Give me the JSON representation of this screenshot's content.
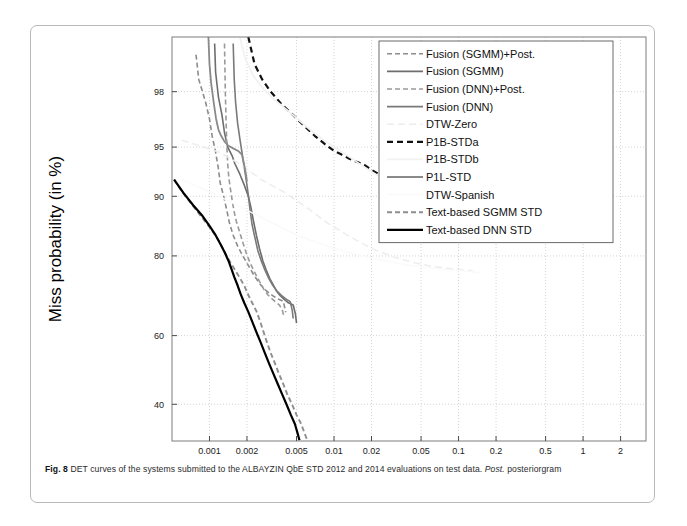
{
  "figure": {
    "caption_prefix": "Fig. 8",
    "caption_body": " DET curves of the systems submitted to the ALBAYZIN QbE STD 2012 and 2014 evaluations on test data. ",
    "caption_italic": "Post.",
    "caption_tail": " posteriorgram"
  },
  "chart_data": {
    "type": "line",
    "title": "",
    "xlabel": "False Alarm probability (in %)",
    "ylabel": "Miss probability (in %)",
    "xticks": [
      "0.001",
      "0.002",
      "0.005",
      "0.01",
      "0.02",
      "0.05",
      "0.1",
      "0.2",
      "0.5",
      "1",
      "2"
    ],
    "xtick_values": [
      0.001,
      0.002,
      0.005,
      0.01,
      0.02,
      0.05,
      0.1,
      0.2,
      0.5,
      1,
      2
    ],
    "yticks": [
      "98",
      "95",
      "90",
      "80",
      "60",
      "40"
    ],
    "ytick_values": [
      98,
      95,
      90,
      80,
      60,
      40
    ],
    "xlim": [
      0.0005,
      3.2
    ],
    "ylim": [
      30,
      99.3
    ],
    "grid": true,
    "legend_position": "top-right",
    "scale": "probit-log",
    "series": [
      {
        "name": "Fusion (SGMM)+Post.",
        "color": "#8c8c8c",
        "dash": "5,3",
        "width": 1.6,
        "points": [
          [
            0.00078,
            99.0
          ],
          [
            0.00082,
            98.4
          ],
          [
            0.00093,
            97.6
          ],
          [
            0.001,
            96.8
          ],
          [
            0.00105,
            95.8
          ],
          [
            0.00112,
            94.6
          ],
          [
            0.00118,
            93.1
          ],
          [
            0.00122,
            91.6
          ],
          [
            0.0013,
            90.0
          ],
          [
            0.00138,
            88.0
          ],
          [
            0.00145,
            86.0
          ],
          [
            0.00155,
            84.0
          ],
          [
            0.00168,
            82.0
          ],
          [
            0.00185,
            80.0
          ],
          [
            0.00205,
            78.0
          ],
          [
            0.00225,
            76.0
          ],
          [
            0.0025,
            74.0
          ],
          [
            0.00275,
            72.5
          ],
          [
            0.003,
            71.5
          ],
          [
            0.0033,
            70.6
          ],
          [
            0.0036,
            69.9
          ],
          [
            0.00392,
            69.4
          ],
          [
            0.004,
            68.0
          ],
          [
            0.0041,
            66.5
          ]
        ]
      },
      {
        "name": "Fusion (SGMM)",
        "color": "#6e6e6e",
        "dash": "none",
        "width": 1.6,
        "points": [
          [
            0.0011,
            99.2
          ],
          [
            0.00112,
            98.6
          ],
          [
            0.00118,
            97.8
          ],
          [
            0.00126,
            97.0
          ],
          [
            0.00132,
            96.0
          ],
          [
            0.0014,
            95.0
          ],
          [
            0.00152,
            94.3
          ],
          [
            0.0016,
            93.6
          ],
          [
            0.00175,
            92.6
          ],
          [
            0.0019,
            91.4
          ],
          [
            0.00205,
            90.0
          ],
          [
            0.00215,
            88.5
          ],
          [
            0.00225,
            86.5
          ],
          [
            0.00238,
            84.0
          ],
          [
            0.00252,
            81.5
          ],
          [
            0.00268,
            79.0
          ],
          [
            0.00285,
            77.0
          ],
          [
            0.00305,
            75.0
          ],
          [
            0.00325,
            73.5
          ],
          [
            0.00345,
            72.0
          ],
          [
            0.0037,
            70.8
          ],
          [
            0.004,
            69.8
          ],
          [
            0.0043,
            69.0
          ],
          [
            0.0047,
            68.4
          ],
          [
            0.0049,
            66.0
          ],
          [
            0.005,
            63.5
          ]
        ]
      },
      {
        "name": "Fusion (DNN)+Post.",
        "color": "#9a9a9a",
        "dash": "5,3",
        "width": 1.6,
        "points": [
          [
            0.00132,
            99.2
          ],
          [
            0.00134,
            98.0
          ],
          [
            0.00136,
            96.6
          ],
          [
            0.00138,
            95.0
          ],
          [
            0.0014,
            93.6
          ],
          [
            0.00143,
            92.2
          ],
          [
            0.00147,
            91.0
          ],
          [
            0.00152,
            89.5
          ],
          [
            0.00158,
            87.8
          ],
          [
            0.00165,
            86.2
          ],
          [
            0.00175,
            84.5
          ],
          [
            0.00186,
            82.5
          ],
          [
            0.00198,
            80.5
          ],
          [
            0.00212,
            78.5
          ],
          [
            0.0023,
            76.5
          ],
          [
            0.0025,
            74.5
          ],
          [
            0.00272,
            72.5
          ],
          [
            0.00295,
            71.0
          ],
          [
            0.00318,
            70.0
          ],
          [
            0.0034,
            69.2
          ],
          [
            0.00365,
            68.4
          ],
          [
            0.00385,
            67.0
          ],
          [
            0.00395,
            65.5
          ]
        ]
      },
      {
        "name": "Fusion (DNN)",
        "color": "#7a7a7a",
        "dash": "none",
        "width": 1.6,
        "points": [
          [
            0.00155,
            99.2
          ],
          [
            0.00158,
            98.4
          ],
          [
            0.00162,
            97.6
          ],
          [
            0.00168,
            96.6
          ],
          [
            0.00176,
            95.5
          ],
          [
            0.00186,
            94.0
          ],
          [
            0.00196,
            92.2
          ],
          [
            0.00205,
            90.2
          ],
          [
            0.00212,
            88.0
          ],
          [
            0.0022,
            85.8
          ],
          [
            0.00232,
            83.5
          ],
          [
            0.00245,
            81.0
          ],
          [
            0.00262,
            78.8
          ],
          [
            0.0028,
            76.8
          ],
          [
            0.003,
            75.0
          ],
          [
            0.00322,
            73.4
          ],
          [
            0.00348,
            72.0
          ],
          [
            0.00378,
            70.9
          ],
          [
            0.0041,
            70.0
          ],
          [
            0.00445,
            69.3
          ],
          [
            0.00462,
            67.0
          ],
          [
            0.0047,
            64.8
          ]
        ]
      },
      {
        "name": "DTW-Zero",
        "color": "#ededed",
        "dash": "7,4",
        "width": 1.5,
        "points": [
          [
            0.0006,
            95.5
          ],
          [
            0.0009,
            95.0
          ],
          [
            0.0012,
            94.6
          ],
          [
            0.0018,
            93.5
          ],
          [
            0.0026,
            92.0
          ],
          [
            0.004,
            90.5
          ],
          [
            0.006,
            88.5
          ],
          [
            0.009,
            86.0
          ],
          [
            0.014,
            83.5
          ],
          [
            0.02,
            81.5
          ],
          [
            0.03,
            79.8
          ],
          [
            0.045,
            78.5
          ],
          [
            0.06,
            77.8
          ],
          [
            0.09,
            77.2
          ],
          [
            0.13,
            76.8
          ]
        ]
      },
      {
        "name": "P1B-STDa",
        "color": "#111111",
        "dash": "6,4",
        "width": 2.2,
        "points": [
          [
            0.00205,
            99.3
          ],
          [
            0.0023,
            98.8
          ],
          [
            0.00265,
            98.4
          ],
          [
            0.0031,
            98.0
          ],
          [
            0.0038,
            97.5
          ],
          [
            0.0047,
            97.0
          ],
          [
            0.0058,
            96.4
          ],
          [
            0.007,
            95.8
          ],
          [
            0.0085,
            95.2
          ],
          [
            0.01,
            94.7
          ],
          [
            0.0115,
            94.4
          ],
          [
            0.013,
            94.1
          ],
          [
            0.015,
            93.8
          ],
          [
            0.0175,
            93.5
          ],
          [
            0.02,
            93.0
          ],
          [
            0.024,
            92.4
          ],
          [
            0.029,
            91.6
          ],
          [
            0.034,
            90.8
          ],
          [
            0.04,
            90.0
          ],
          [
            0.047,
            89.2
          ],
          [
            0.054,
            88.5
          ],
          [
            0.062,
            88.0
          ],
          [
            0.07,
            87.6
          ]
        ]
      },
      {
        "name": "P1B-STDb",
        "color": "#f2f2f2",
        "dash": "none",
        "width": 1.8,
        "points": [
          [
            0.00175,
            99.3
          ],
          [
            0.00195,
            98.9
          ],
          [
            0.00225,
            98.5
          ],
          [
            0.0027,
            98.1
          ],
          [
            0.0033,
            97.7
          ],
          [
            0.0041,
            97.3
          ],
          [
            0.0051,
            96.8
          ],
          [
            0.0064,
            96.2
          ],
          [
            0.008,
            95.6
          ],
          [
            0.01,
            95.0
          ],
          [
            0.0125,
            94.4
          ],
          [
            0.0155,
            93.7
          ],
          [
            0.019,
            93.0
          ],
          [
            0.024,
            92.2
          ],
          [
            0.03,
            91.3
          ],
          [
            0.038,
            90.3
          ],
          [
            0.047,
            89.3
          ],
          [
            0.058,
            88.4
          ],
          [
            0.07,
            87.6
          ]
        ]
      },
      {
        "name": "P1L-STD",
        "color": "#8a8a8a",
        "dash": "none",
        "width": 1.8,
        "points": [
          [
            0.00098,
            99.3
          ],
          [
            0.001,
            98.8
          ],
          [
            0.00103,
            98.3
          ],
          [
            0.00108,
            97.6
          ],
          [
            0.00113,
            96.8
          ],
          [
            0.00118,
            96.2
          ],
          [
            0.00124,
            95.8
          ],
          [
            0.00132,
            95.4
          ],
          [
            0.00142,
            95.1
          ],
          [
            0.00155,
            94.9
          ],
          [
            0.0017,
            94.7
          ],
          [
            0.00182,
            94.4
          ],
          [
            0.0019,
            93.5
          ],
          [
            0.00196,
            92.6
          ],
          [
            0.002,
            91.8
          ]
        ]
      },
      {
        "name": "DTW-Spanish",
        "color": "#fafafa",
        "dash": "none",
        "width": 1.5,
        "points": [
          [
            0.0006,
            92.0
          ],
          [
            0.0012,
            90.0
          ],
          [
            0.0026,
            87.0
          ],
          [
            0.005,
            84.0
          ],
          [
            0.01,
            81.5
          ],
          [
            0.02,
            79.5
          ],
          [
            0.04,
            78.0
          ],
          [
            0.08,
            77.0
          ],
          [
            0.15,
            76.4
          ]
        ]
      },
      {
        "name": "Text-based SGMM STD",
        "color": "#8f8f8f",
        "dash": "5,3",
        "width": 1.9,
        "points": [
          [
            0.00052,
            92.0
          ],
          [
            0.0006,
            90.6
          ],
          [
            0.0007,
            89.2
          ],
          [
            0.00082,
            87.6
          ],
          [
            0.00095,
            86.0
          ],
          [
            0.00108,
            84.4
          ],
          [
            0.0012,
            82.8
          ],
          [
            0.0013,
            81.2
          ],
          [
            0.0014,
            79.6
          ],
          [
            0.00152,
            78.0
          ],
          [
            0.00165,
            76.4
          ],
          [
            0.00178,
            74.8
          ],
          [
            0.00192,
            73.0
          ],
          [
            0.00205,
            71.0
          ],
          [
            0.0022,
            69.0
          ],
          [
            0.00238,
            66.8
          ],
          [
            0.00255,
            64.0
          ],
          [
            0.00272,
            61.0
          ],
          [
            0.0029,
            58.0
          ],
          [
            0.0031,
            55.0
          ],
          [
            0.00335,
            52.0
          ],
          [
            0.0036,
            49.0
          ],
          [
            0.0039,
            46.0
          ],
          [
            0.0042,
            43.0
          ],
          [
            0.0046,
            40.0
          ],
          [
            0.005,
            37.0
          ],
          [
            0.00545,
            34.5
          ],
          [
            0.0058,
            32.0
          ],
          [
            0.0061,
            30.2
          ]
        ]
      },
      {
        "name": "Text-based DNN STD",
        "color": "#000000",
        "dash": "none",
        "width": 2.2,
        "points": [
          [
            0.00052,
            92.0
          ],
          [
            0.00062,
            90.4
          ],
          [
            0.00074,
            88.8
          ],
          [
            0.00088,
            87.2
          ],
          [
            0.001,
            85.6
          ],
          [
            0.00112,
            84.0
          ],
          [
            0.00122,
            82.4
          ],
          [
            0.00132,
            80.8
          ],
          [
            0.00142,
            79.0
          ],
          [
            0.0015,
            77.2
          ],
          [
            0.00158,
            75.4
          ],
          [
            0.00168,
            73.4
          ],
          [
            0.00178,
            71.2
          ],
          [
            0.0019,
            69.0
          ],
          [
            0.00205,
            66.6
          ],
          [
            0.0022,
            64.0
          ],
          [
            0.00238,
            61.0
          ],
          [
            0.00258,
            58.0
          ],
          [
            0.00278,
            55.0
          ],
          [
            0.003,
            52.0
          ],
          [
            0.00325,
            49.0
          ],
          [
            0.00352,
            46.0
          ],
          [
            0.00382,
            43.0
          ],
          [
            0.00415,
            40.0
          ],
          [
            0.0045,
            37.0
          ],
          [
            0.00485,
            34.5
          ],
          [
            0.0051,
            32.0
          ],
          [
            0.00528,
            30.2
          ]
        ]
      }
    ]
  },
  "legend": {
    "items": [
      "Fusion (SGMM)+Post.",
      "Fusion (SGMM)",
      "Fusion (DNN)+Post.",
      "Fusion (DNN)",
      "DTW-Zero",
      "P1B-STDa",
      "P1B-STDb",
      "P1L-STD",
      "DTW-Spanish",
      "Text-based SGMM STD",
      "Text-based DNN STD"
    ]
  }
}
